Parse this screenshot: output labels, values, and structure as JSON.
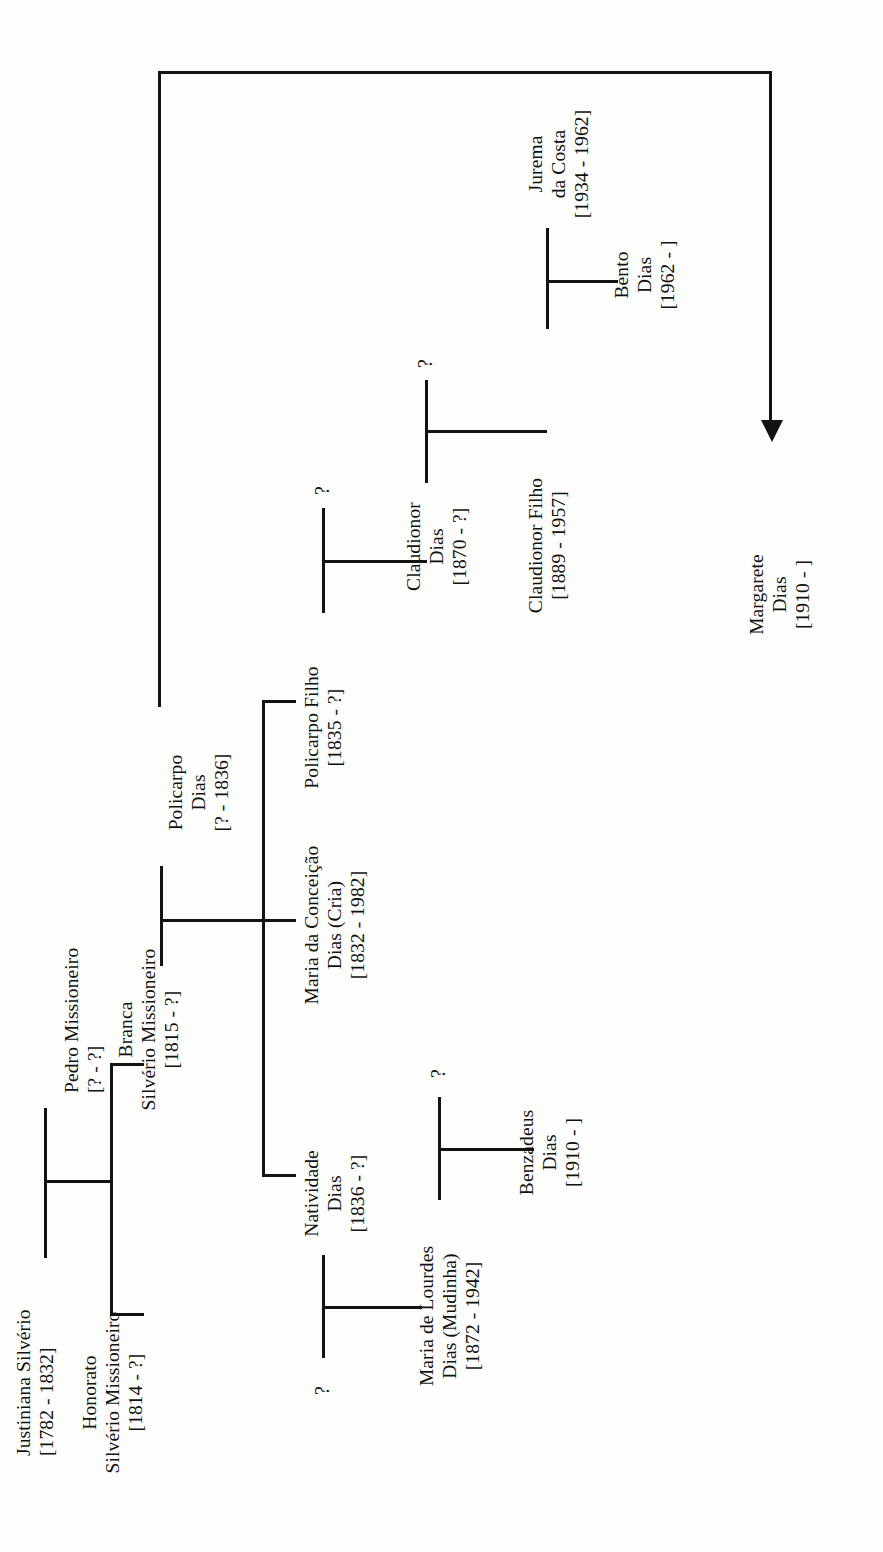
{
  "document": {
    "type": "genealogy-chart",
    "family": "Dias / Silvério Missioneiro",
    "orientation": "rotated-90-ccw",
    "background_color": "#fdfdfc",
    "line_color": "#131313"
  },
  "people": {
    "justiniana": {
      "name_line1": "Justiniana Silvério",
      "dates": "[1782 - 1832]"
    },
    "pedro": {
      "name_line1": "Pedro Missioneiro",
      "dates": "[? - ?]"
    },
    "honorato": {
      "name_line1": "Honorato",
      "name_line2": "Silvério Missioneiro",
      "dates": "[1814 - ?]"
    },
    "branca": {
      "name_line1": "Branca",
      "name_line2": "Silvério Missioneiro",
      "dates": "[1815 - ?]"
    },
    "policarpo": {
      "name_line1": "Policarpo",
      "name_line2": "Dias",
      "dates": "[? - 1836]"
    },
    "natividade": {
      "name_line1": "Natividade",
      "name_line2": "Dias",
      "dates": "[1836 - ?]"
    },
    "maria_conceicao": {
      "name_line1": "Maria da Conceição",
      "name_line2": "Dias (Cria)",
      "dates": "[1832 - 1982]"
    },
    "policarpo_filho": {
      "name_line1": "Policarpo Filho",
      "dates": "[1835 - ?]"
    },
    "maria_lourdes": {
      "name_line1": "Maria de Lourdes",
      "name_line2": "Dias (Mudinha)",
      "dates": "[1872 - 1942]"
    },
    "benzadeus": {
      "name_line1": "Benzadeus",
      "name_line2": "Dias",
      "dates": "[1910 - ]"
    },
    "claudionor": {
      "name_line1": "Claudionor",
      "name_line2": "Dias",
      "dates": "[1870 - ?]"
    },
    "claudionor_filho": {
      "name_line1": "Claudionor Filho",
      "dates": "[1889 - 1957]"
    },
    "jurema": {
      "name_line1": "Jurema",
      "name_line2": "da Costa",
      "dates": "[1934 - 1962]"
    },
    "bento": {
      "name_line1": "Bento",
      "name_line2": "Dias",
      "dates": "[1962 - ]"
    },
    "margarete": {
      "name_line1": "Margarete",
      "name_line2": "Dias",
      "dates": "[1910 - ]"
    }
  },
  "unknown_spouses": {
    "u_natividade": "?",
    "u_maria_lourdes": "?",
    "u_policarpo_filho": "?",
    "u_claudionor": "?",
    "u_claudionor_filho": "?"
  },
  "icons": {
    "descent_arrow": "arrow-down-icon"
  }
}
